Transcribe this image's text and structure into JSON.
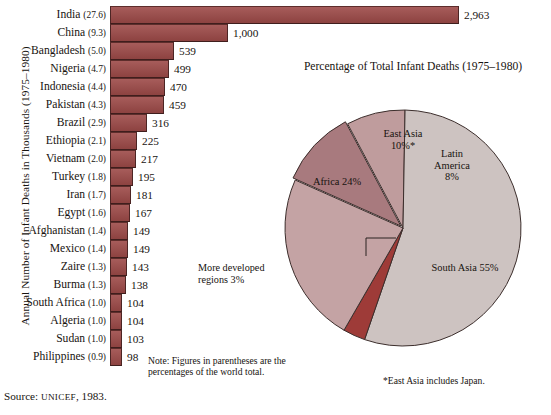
{
  "figure": {
    "source": "Source: ",
    "source_org": "UNICEF",
    "source_year": ", 1983.",
    "note": "Note: Figures in parentheses are the percentages of the world total."
  },
  "bar_axis_title": "Annual Number of Infant Deaths in Thousands (1975–1980)",
  "pie_title": "Percentage of Total Infant Deaths (1975–1980)",
  "pie_footnote": "*East Asia includes Japan.",
  "callout": {
    "line1": "More developed",
    "line2": "regions 3%"
  },
  "colors": {
    "bar_fill": "#9d4a48",
    "bar_stroke": "#4c2524",
    "pie_more_developed": "#9e3b38",
    "pie_east_asia": "#a87a7e",
    "pie_africa": "#c4a3a4",
    "pie_latin_america": "#bf9c9d",
    "pie_south_asia": "#cdc3c1",
    "pie_stroke": "#3c2e2c",
    "text": "#17130f"
  },
  "chart_data": [
    {
      "type": "bar",
      "title": "",
      "xlabel": "",
      "ylabel": "Annual Number of Infant Deaths in Thousands (1975–1980)",
      "orientation": "horizontal",
      "grid": false,
      "xlim": [
        0,
        2963
      ],
      "categories": [
        "India",
        "China",
        "Bangladesh",
        "Nigeria",
        "Indonesia",
        "Pakistan",
        "Brazil",
        "Ethiopia",
        "Vietnam",
        "Turkey",
        "Iran",
        "Egypt",
        "Afghanistan",
        "Mexico",
        "Zaire",
        "Burma",
        "South Africa",
        "Algeria",
        "Sudan",
        "Philippines"
      ],
      "values": [
        2963,
        1000,
        539,
        499,
        470,
        459,
        316,
        225,
        217,
        195,
        181,
        167,
        149,
        149,
        143,
        138,
        104,
        104,
        103,
        98
      ],
      "value_labels": [
        "2,963",
        "1,000",
        "539",
        "499",
        "470",
        "459",
        "316",
        "225",
        "217",
        "195",
        "181",
        "167",
        "149",
        "149",
        "143",
        "138",
        "104",
        "104",
        "103",
        "98"
      ],
      "world_share_pct": [
        27.6,
        9.3,
        5.0,
        4.7,
        4.4,
        4.3,
        2.9,
        2.1,
        2.0,
        1.8,
        1.7,
        1.6,
        1.4,
        1.4,
        1.3,
        1.3,
        1.0,
        1.0,
        1.0,
        0.9
      ],
      "share_labels": [
        "(27.6)",
        "(9.3)",
        "(5.0)",
        "(4.7)",
        "(4.4)",
        "(4.3)",
        "(2.9)",
        "(2.1)",
        "(2.0)",
        "(1.8)",
        "(1.7)",
        "(1.6)",
        "(1.4)",
        "(1.4)",
        "(1.3)",
        "(1.3)",
        "(1.0)",
        "(1.0)",
        "(1.0)",
        "(0.9)"
      ]
    },
    {
      "type": "pie",
      "title": "Percentage of Total Infant Deaths (1975–1980)",
      "legend": "labels-on-slices",
      "categories": [
        "South Asia",
        "Africa",
        "East Asia",
        "Latin America",
        "More developed regions"
      ],
      "values": [
        55,
        24,
        10,
        8,
        3
      ],
      "slice_labels": [
        "South Asia 55%",
        "Africa 24%",
        "East Asia 10%*",
        "Latin America 8%",
        "More developed regions 3%"
      ],
      "annotations": [
        "*East Asia includes Japan."
      ]
    }
  ],
  "bar_rows": [
    {
      "name": "India",
      "share": "(27.6)",
      "value": 2963,
      "label": "2,963"
    },
    {
      "name": "China",
      "share": "(9.3)",
      "value": 1000,
      "label": "1,000"
    },
    {
      "name": "Bangladesh",
      "share": "(5.0)",
      "value": 539,
      "label": "539"
    },
    {
      "name": "Nigeria",
      "share": "(4.7)",
      "value": 499,
      "label": "499"
    },
    {
      "name": "Indonesia",
      "share": "(4.4)",
      "value": 470,
      "label": "470"
    },
    {
      "name": "Pakistan",
      "share": "(4.3)",
      "value": 459,
      "label": "459"
    },
    {
      "name": "Brazil",
      "share": "(2.9)",
      "value": 316,
      "label": "316"
    },
    {
      "name": "Ethiopia",
      "share": "(2.1)",
      "value": 225,
      "label": "225"
    },
    {
      "name": "Vietnam",
      "share": "(2.0)",
      "value": 217,
      "label": "217"
    },
    {
      "name": "Turkey",
      "share": "(1.8)",
      "value": 195,
      "label": "195"
    },
    {
      "name": "Iran",
      "share": "(1.7)",
      "value": 181,
      "label": "181"
    },
    {
      "name": "Egypt",
      "share": "(1.6)",
      "value": 167,
      "label": "167"
    },
    {
      "name": "Afghanistan",
      "share": "(1.4)",
      "value": 149,
      "label": "149"
    },
    {
      "name": "Mexico",
      "share": "(1.4)",
      "value": 149,
      "label": "149"
    },
    {
      "name": "Zaire",
      "share": "(1.3)",
      "value": 143,
      "label": "143"
    },
    {
      "name": "Burma",
      "share": "(1.3)",
      "value": 138,
      "label": "138"
    },
    {
      "name": "South Africa",
      "share": "(1.0)",
      "value": 104,
      "label": "104"
    },
    {
      "name": "Algeria",
      "share": "(1.0)",
      "value": 104,
      "label": "104"
    },
    {
      "name": "Sudan",
      "share": "(1.0)",
      "value": 103,
      "label": "103"
    },
    {
      "name": "Philippines",
      "share": "(0.9)",
      "value": 98,
      "label": "98"
    }
  ],
  "pie_slices": [
    {
      "name": "East Asia",
      "label_line1": "East Asia",
      "label_line2": "10%*"
    },
    {
      "name": "Latin America",
      "label_line1": "Latin",
      "label_line2": "America",
      "label_line3": "8%"
    },
    {
      "name": "South Asia",
      "label_line1": "South Asia 55%"
    },
    {
      "name": "Africa",
      "label_line1": "Africa 24%"
    }
  ]
}
